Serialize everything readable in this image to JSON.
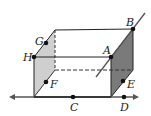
{
  "diagram": {
    "type": "rectangular-prism",
    "colors": {
      "left_face": "#cfcfcf",
      "right_face": "#7a7a7a",
      "edge": "#222222",
      "line": "#555555",
      "point": "#111111"
    },
    "points": {
      "A": {
        "label": "A"
      },
      "B": {
        "label": "B"
      },
      "C": {
        "label": "C"
      },
      "D": {
        "label": "D"
      },
      "E": {
        "label": "E"
      },
      "F": {
        "label": "F"
      },
      "G": {
        "label": "G"
      },
      "H": {
        "label": "H"
      }
    },
    "lines": [
      "line AB",
      "line CD"
    ]
  }
}
